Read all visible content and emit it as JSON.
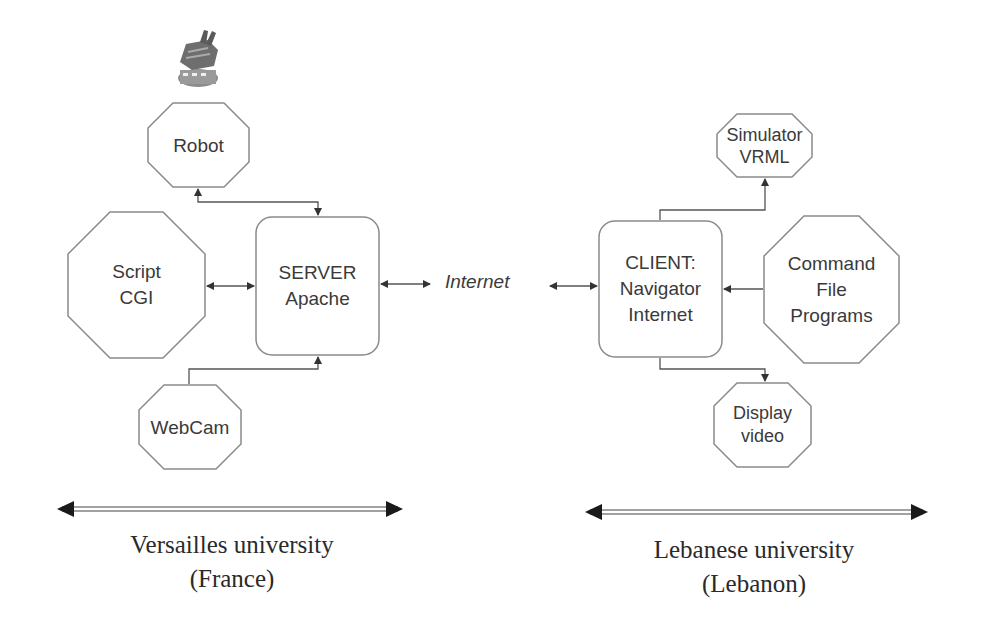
{
  "diagram": {
    "nodes": {
      "robot": {
        "label": "Robot",
        "shape": "octagon",
        "icon": "robot-arm-icon"
      },
      "script_cgi": {
        "line1": "Script",
        "line2": "CGI",
        "shape": "octagon"
      },
      "server": {
        "line1": "SERVER",
        "line2": "Apache",
        "shape": "rounded-rect"
      },
      "webcam": {
        "label": "WebCam",
        "shape": "octagon"
      },
      "internet": {
        "label": "Internet"
      },
      "client": {
        "line1": "CLIENT:",
        "line2": "Navigator",
        "line3": "Internet",
        "shape": "rounded-rect"
      },
      "simulator": {
        "line1": "Simulator",
        "line2": "VRML",
        "shape": "octagon"
      },
      "command": {
        "line1": "Command",
        "line2": "File",
        "line3": "Programs",
        "shape": "octagon"
      },
      "display": {
        "line1": "Display",
        "line2": "video",
        "shape": "octagon"
      }
    },
    "edges": [
      {
        "from": "robot",
        "to": "server",
        "direction": "both"
      },
      {
        "from": "script_cgi",
        "to": "server",
        "direction": "both"
      },
      {
        "from": "webcam",
        "to": "server",
        "direction": "forward"
      },
      {
        "from": "server",
        "to": "internet",
        "direction": "both"
      },
      {
        "from": "internet",
        "to": "client",
        "direction": "both"
      },
      {
        "from": "client",
        "to": "simulator",
        "direction": "forward"
      },
      {
        "from": "command",
        "to": "client",
        "direction": "forward"
      },
      {
        "from": "client",
        "to": "display",
        "direction": "forward"
      }
    ],
    "sites": {
      "left": {
        "line1": "Versailles university",
        "line2": "(France)"
      },
      "right": {
        "line1": "Lebanese university",
        "line2": "(Lebanon)"
      }
    },
    "colors": {
      "stroke": "#8a8a8a",
      "text": "#3a3a3a",
      "arrow": "#333333",
      "background": "#ffffff"
    }
  }
}
